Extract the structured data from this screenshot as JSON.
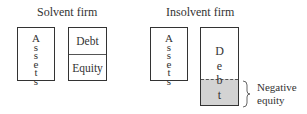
{
  "solvent": {
    "title": "Solvent firm",
    "assets_letters": [
      "A",
      "s",
      "s",
      "e",
      "t",
      "s"
    ],
    "debt_label": "Debt",
    "equity_label": "Equity"
  },
  "insolvent": {
    "title": "Insolvent firm",
    "assets_letters": [
      "A",
      "s",
      "s",
      "e",
      "t",
      "s"
    ],
    "debt_letters": [
      "D",
      "e",
      "b",
      "t"
    ],
    "negative_equity_label_line1": "Negative",
    "negative_equity_label_line2": "equity"
  },
  "colors": {
    "border": "#333333",
    "negative_fill": "#d3d3d3"
  }
}
